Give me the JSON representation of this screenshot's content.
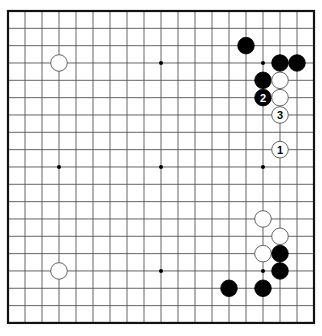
{
  "board": {
    "size": 19,
    "origin_x": 8,
    "origin_y": 11,
    "spacing_x": 17,
    "spacing_y": 17.33,
    "stone_radius": 8.3,
    "colors": {
      "black": "#000000",
      "white": "#ffffff",
      "line": "#555555",
      "frame": "#111111"
    },
    "star_points": [
      [
        4,
        4
      ],
      [
        10,
        4
      ],
      [
        16,
        4
      ],
      [
        4,
        10
      ],
      [
        10,
        10
      ],
      [
        16,
        10
      ],
      [
        4,
        16
      ],
      [
        10,
        16
      ],
      [
        16,
        16
      ]
    ]
  },
  "stones": [
    {
      "color": "white",
      "col": 4,
      "row": 4
    },
    {
      "color": "white",
      "col": 4,
      "row": 16
    },
    {
      "color": "black",
      "col": 15,
      "row": 3
    },
    {
      "color": "black",
      "col": 17,
      "row": 4
    },
    {
      "color": "black",
      "col": 18,
      "row": 4
    },
    {
      "color": "black",
      "col": 16,
      "row": 5
    },
    {
      "color": "white",
      "col": 17,
      "row": 5
    },
    {
      "color": "black",
      "col": 16,
      "row": 6,
      "label": "2"
    },
    {
      "color": "white",
      "col": 17,
      "row": 6
    },
    {
      "color": "white",
      "col": 17,
      "row": 7,
      "label": "3"
    },
    {
      "color": "white",
      "col": 17,
      "row": 9,
      "label": "1"
    },
    {
      "color": "white",
      "col": 16,
      "row": 13
    },
    {
      "color": "white",
      "col": 17,
      "row": 14
    },
    {
      "color": "white",
      "col": 16,
      "row": 15
    },
    {
      "color": "black",
      "col": 17,
      "row": 15
    },
    {
      "color": "black",
      "col": 17,
      "row": 16
    },
    {
      "color": "black",
      "col": 14,
      "row": 17
    },
    {
      "color": "black",
      "col": 16,
      "row": 17
    }
  ]
}
